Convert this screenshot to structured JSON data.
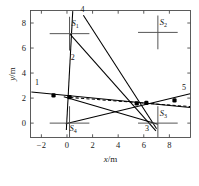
{
  "chart_data": {
    "type": "scatter",
    "title": "",
    "xlabel": "x/m",
    "ylabel": "y/m",
    "xlim": [
      -2.85,
      9.65
    ],
    "ylim": [
      -1.15,
      9.0
    ],
    "grid": false,
    "legend_position": "none",
    "xticks": [
      -2,
      0,
      2,
      4,
      6,
      8
    ],
    "xtick_labels": [
      "−2",
      "0",
      "2",
      "4",
      "6",
      "8"
    ],
    "yticks": [
      0,
      2,
      4,
      6,
      8
    ],
    "ytick_labels": [
      "0",
      "2",
      "4",
      "6",
      "8"
    ],
    "station_markers": [
      {
        "name": "S1",
        "label": "S",
        "sub": "1",
        "x": 0.2,
        "y": 7.15,
        "arm_x": 1.55,
        "arm_y": 1.35,
        "label_dx": 0.25,
        "label_dy": 0.95
      },
      {
        "name": "S2",
        "label": "S",
        "sub": "2",
        "x": 7.1,
        "y": 7.25,
        "arm_x": 1.55,
        "arm_y": 1.35,
        "label_dx": 0.25,
        "label_dy": 0.95
      },
      {
        "name": "S3",
        "label": "S",
        "sub": "3",
        "x": 7.1,
        "y": 0.0,
        "arm_x": 1.55,
        "arm_y": 1.35,
        "label_dx": 0.25,
        "label_dy": 0.95
      },
      {
        "name": "S4",
        "label": "S",
        "sub": "4",
        "x": 0.2,
        "y": 0.0,
        "arm_x": 1.55,
        "arm_y": 1.35,
        "label_dx": 0.0,
        "label_dy": -0.95
      }
    ],
    "lines": [
      {
        "id": "1",
        "style": "solid",
        "label": "1",
        "label_x": -2.35,
        "label_y": 3.05,
        "points": [
          [
            -2.78,
            2.48
          ],
          [
            9.62,
            1.25
          ]
        ]
      },
      {
        "id": "2",
        "style": "solid",
        "label": "2",
        "label_x": 0.45,
        "label_y": 5.05,
        "points": [
          [
            0.45,
            8.95
          ],
          [
            -0.05,
            -0.55
          ]
        ]
      },
      {
        "id": "3",
        "style": "solid",
        "label": "3",
        "label_x": 6.25,
        "label_y": -0.62,
        "points": [
          [
            0.2,
            7.15
          ],
          [
            6.95,
            -0.62
          ]
        ]
      },
      {
        "id": "4",
        "style": "solid",
        "label": "4",
        "label_x": 1.22,
        "label_y": 8.85,
        "points": [
          [
            1.28,
            8.62
          ],
          [
            7.0,
            -0.45
          ]
        ]
      },
      {
        "id": "5",
        "style": "solid",
        "label": "5",
        "label_x": 9.15,
        "label_y": 2.62,
        "points": [
          [
            -0.1,
            -0.05
          ],
          [
            9.62,
            2.35
          ]
        ]
      },
      {
        "id": "6",
        "style": "solid",
        "label": "",
        "label_x": 0,
        "label_y": 0,
        "points": [
          [
            -0.25,
            2.1
          ],
          [
            7.1,
            -0.1
          ]
        ]
      },
      {
        "id": "dashed",
        "style": "dashed",
        "label": "",
        "label_x": 0,
        "label_y": 0,
        "points": [
          [
            0.25,
            2.05
          ],
          [
            9.62,
            1.32
          ]
        ]
      }
    ],
    "data_points": [
      {
        "x": -1.05,
        "y": 2.22
      },
      {
        "x": 0.2,
        "y": 2.08
      },
      {
        "x": 5.45,
        "y": 1.58
      },
      {
        "x": 6.2,
        "y": 1.62
      },
      {
        "x": 8.4,
        "y": 1.82
      }
    ]
  }
}
